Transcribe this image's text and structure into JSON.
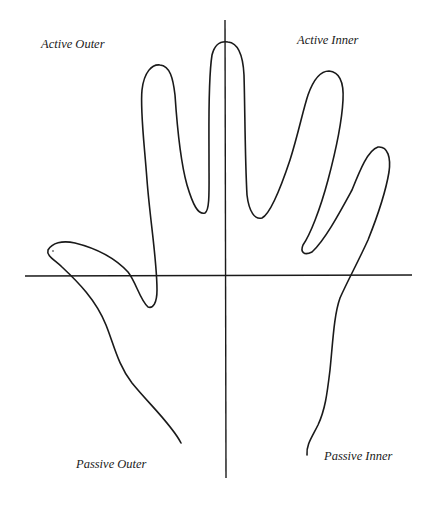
{
  "diagram": {
    "title": "",
    "quadrants": {
      "top_left": "Active Outer",
      "top_right": "Active Inner",
      "bottom_left": "Passive Outer",
      "bottom_right": "Passive Inner"
    },
    "axes": {
      "horizontal": {
        "x1": 25,
        "y1": 276,
        "x2": 412,
        "y2": 276
      },
      "vertical": {
        "x1": 225,
        "y1": 20,
        "x2": 225,
        "y2": 478
      }
    },
    "colors": {
      "stroke": "#1a1a1a",
      "background": "#ffffff",
      "text": "#1a1a1a"
    }
  }
}
